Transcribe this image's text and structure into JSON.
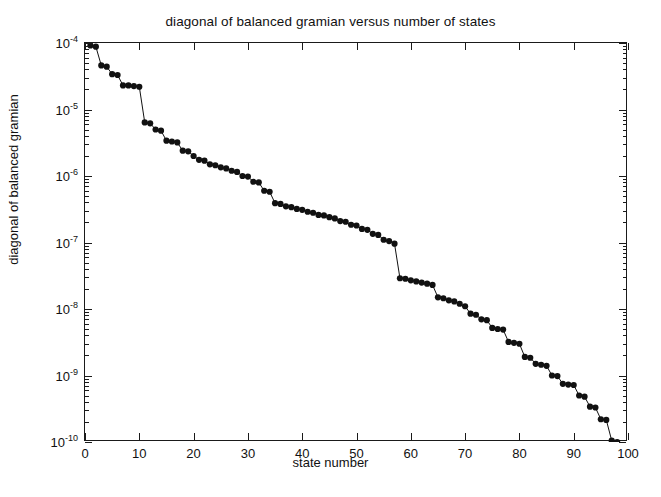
{
  "chart_data": {
    "type": "scatter",
    "title": "diagonal of balanced gramian versus number of states",
    "xlabel": "state number",
    "ylabel": "diagonal of balanced gramian",
    "yscale": "log",
    "xscale": "linear",
    "xlim": [
      0,
      100
    ],
    "ylim": [
      1e-10,
      0.0001
    ],
    "grid": false,
    "legend": null,
    "marker": "filled-circle",
    "line_style": "solid",
    "series_color": "#111111",
    "x_ticks": [
      0,
      10,
      20,
      30,
      40,
      50,
      60,
      70,
      80,
      90,
      100
    ],
    "x_tick_labels": [
      "0",
      "10",
      "20",
      "30",
      "40",
      "50",
      "60",
      "70",
      "80",
      "90",
      "100"
    ],
    "y_ticks": [
      0.0001,
      1e-05,
      1e-06,
      1e-07,
      1e-08,
      1e-09,
      1e-10
    ],
    "y_tick_labels": [
      "10-4",
      "10-5",
      "10-6",
      "10-7",
      "10-8",
      "10-9",
      "10-10"
    ],
    "y_tick_mantissas": [
      "10",
      "10",
      "10",
      "10",
      "10",
      "10",
      "10"
    ],
    "y_tick_exponents": [
      "-4",
      "-5",
      "-6",
      "-7",
      "-8",
      "-9",
      "-10"
    ],
    "x": [
      1,
      2,
      3,
      4,
      5,
      6,
      7,
      8,
      9,
      10,
      11,
      12,
      13,
      14,
      15,
      16,
      17,
      18,
      19,
      20,
      21,
      22,
      23,
      24,
      25,
      26,
      27,
      28,
      29,
      30,
      31,
      32,
      33,
      34,
      35,
      36,
      37,
      38,
      39,
      40,
      41,
      42,
      43,
      44,
      45,
      46,
      47,
      48,
      49,
      50,
      51,
      52,
      53,
      54,
      55,
      56,
      57,
      58,
      59,
      60,
      61,
      62,
      63,
      64,
      65,
      66,
      67,
      68,
      69,
      70,
      71,
      72,
      73,
      74,
      75,
      76,
      77,
      78,
      79,
      80,
      81,
      82,
      83,
      84,
      85,
      86,
      87,
      88,
      89,
      90,
      91,
      92,
      93,
      94,
      95,
      96,
      97,
      98
    ],
    "y": [
      9.2e-05,
      8.8e-05,
      4.6e-05,
      4.4e-05,
      3.4e-05,
      3.3e-05,
      2.3e-05,
      2.3e-05,
      2.25e-05,
      2.2e-05,
      6.4e-06,
      6.2e-06,
      5e-06,
      4.8e-06,
      3.4e-06,
      3.3e-06,
      3.2e-06,
      2.4e-06,
      2.35e-06,
      2e-06,
      1.75e-06,
      1.7e-06,
      1.5e-06,
      1.45e-06,
      1.35e-06,
      1.3e-06,
      1.2e-06,
      1.15e-06,
      1e-06,
      9.8e-07,
      8.2e-07,
      8e-07,
      6e-07,
      5.8e-07,
      3.9e-07,
      3.8e-07,
      3.5e-07,
      3.4e-07,
      3.2e-07,
      3.1e-07,
      2.9e-07,
      2.8e-07,
      2.6e-07,
      2.55e-07,
      2.4e-07,
      2.3e-07,
      2.1e-07,
      2.05e-07,
      1.85e-07,
      1.8e-07,
      1.6e-07,
      1.55e-07,
      1.35e-07,
      1.3e-07,
      1.1e-07,
      1.05e-07,
      9.6e-08,
      2.9e-08,
      2.85e-08,
      2.7e-08,
      2.6e-08,
      2.5e-08,
      2.4e-08,
      2.3e-08,
      1.5e-08,
      1.45e-08,
      1.35e-08,
      1.3e-08,
      1.2e-08,
      1.1e-08,
      8.5e-09,
      8.2e-09,
      7e-09,
      6.8e-09,
      5.2e-09,
      5e-09,
      4.9e-09,
      3.2e-09,
      3.1e-09,
      3e-09,
      1.9e-09,
      1.85e-09,
      1.5e-09,
      1.45e-09,
      1.4e-09,
      1e-09,
      9.8e-10,
      7.5e-10,
      7.3e-10,
      7.2e-10,
      5e-10,
      4.8e-10,
      3.4e-10,
      3.3e-10,
      2.2e-10,
      2.15e-10,
      1.05e-10,
      1e-10
    ]
  }
}
